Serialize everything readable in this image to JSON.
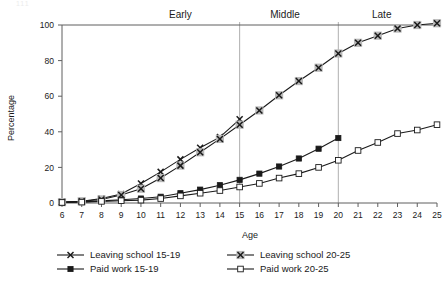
{
  "chart_data": {
    "type": "line",
    "title": "",
    "xlabel": "Age",
    "ylabel": "Percentage",
    "xlim": [
      6,
      25
    ],
    "ylim": [
      0,
      100
    ],
    "grid": false,
    "legend_position": "bottom",
    "x": [
      6,
      7,
      8,
      9,
      10,
      11,
      12,
      13,
      14,
      15,
      16,
      17,
      18,
      19,
      20,
      21,
      22,
      23,
      24,
      25
    ],
    "yticks": [
      0,
      20,
      40,
      60,
      80,
      100
    ],
    "xticks": [
      6,
      7,
      8,
      9,
      10,
      11,
      12,
      13,
      14,
      15,
      16,
      17,
      18,
      19,
      20,
      21,
      22,
      23,
      24,
      25
    ],
    "annotations": [
      {
        "label": "Early",
        "x": 12.0,
        "type": "phase-band-label"
      },
      {
        "label": "Middle",
        "x": 17.3,
        "type": "phase-band-label"
      },
      {
        "label": "Late",
        "x": 22.2,
        "type": "phase-band-label"
      }
    ],
    "reference_lines": [
      {
        "x": 15,
        "orientation": "vertical"
      },
      {
        "x": 20,
        "orientation": "vertical"
      }
    ],
    "series": [
      {
        "name": "Leaving school 15-19",
        "marker": "x",
        "fill": "none",
        "x": [
          6,
          7,
          8,
          9,
          10,
          11,
          12,
          13,
          14,
          15
        ],
        "values": [
          0.5,
          1.0,
          2.5,
          5.0,
          11.0,
          17.5,
          24.5,
          31.0,
          37.0,
          47.0
        ]
      },
      {
        "name": "Leaving school 20-25",
        "marker": "x-boxed",
        "fill": "halo",
        "x": [
          6,
          7,
          8,
          9,
          10,
          11,
          12,
          13,
          14,
          15,
          16,
          17,
          18,
          19,
          20,
          21,
          22,
          23,
          24,
          25
        ],
        "values": [
          0.5,
          1.0,
          2.0,
          4.5,
          8.0,
          14.0,
          21.0,
          28.5,
          36.0,
          44.0,
          52.0,
          60.5,
          68.5,
          76.0,
          84.0,
          90.0,
          94.0,
          98.0,
          100.0,
          101.0
        ]
      },
      {
        "name": "Paid work 15-19",
        "marker": "square",
        "fill": "solid",
        "x": [
          6,
          7,
          8,
          9,
          10,
          11,
          12,
          13,
          14,
          15,
          16,
          17,
          18,
          19,
          20
        ],
        "values": [
          0.3,
          0.6,
          1.2,
          1.8,
          2.5,
          3.5,
          5.5,
          7.5,
          10.0,
          13.0,
          16.5,
          20.5,
          25.0,
          30.5,
          36.5
        ]
      },
      {
        "name": "Paid work 20-25",
        "marker": "square",
        "fill": "open",
        "x": [
          6,
          7,
          8,
          9,
          10,
          11,
          12,
          13,
          14,
          15,
          16,
          17,
          18,
          19,
          20,
          21,
          22,
          23,
          24,
          25
        ],
        "values": [
          0.3,
          0.5,
          0.9,
          1.3,
          1.6,
          2.5,
          4.0,
          5.5,
          7.0,
          9.0,
          11.0,
          14.0,
          16.5,
          20.0,
          24.0,
          29.5,
          34.0,
          39.0,
          41.0,
          44.0
        ]
      }
    ]
  },
  "legend": {
    "items": [
      {
        "label": "Leaving school 15-19",
        "marker": "x"
      },
      {
        "label": "Leaving school 20-25",
        "marker": "x-boxed"
      },
      {
        "label": "Paid work 15-19",
        "marker": "square-solid"
      },
      {
        "label": "Paid work 20-25",
        "marker": "square-open"
      }
    ]
  },
  "colors": {
    "line": "#1a1a1a",
    "axis": "#5f5f5f",
    "reference": "#9a9a9a",
    "halo": "#b9b9b9",
    "background": "#ffffff"
  }
}
